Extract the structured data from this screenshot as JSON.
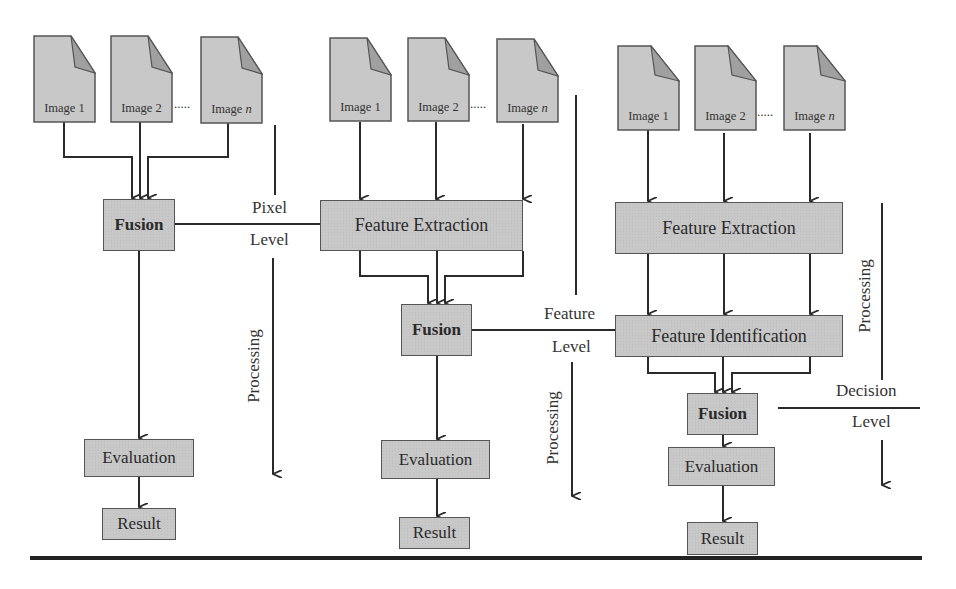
{
  "diagram": {
    "type": "image-fusion-levels",
    "columns": [
      {
        "id": "pixel",
        "inputs": [
          "Image 1",
          "Image 2",
          "Image n"
        ],
        "ellipsis": ".....",
        "steps": [
          "Fusion",
          "Evaluation",
          "Result"
        ]
      },
      {
        "id": "feature",
        "inputs": [
          "Image 1",
          "Image 2",
          "Image n"
        ],
        "ellipsis": ".....",
        "steps": [
          "Feature Extraction",
          "Fusion",
          "Evaluation",
          "Result"
        ]
      },
      {
        "id": "decision",
        "inputs": [
          "Image 1",
          "Image 2",
          "Image n"
        ],
        "ellipsis": ".....",
        "steps": [
          "Feature Extraction",
          "Feature Identification",
          "Fusion",
          "Evaluation",
          "Result"
        ]
      }
    ],
    "levels": {
      "pixel": {
        "top": "Pixel",
        "bottom": "Level",
        "processing": "Processing"
      },
      "feature": {
        "top": "Feature",
        "bottom": "Level",
        "processing": "Processing"
      },
      "decision": {
        "top": "Decision",
        "bottom": "Level",
        "processing": "Processing"
      }
    },
    "labels": {
      "image_prefix": "Image ",
      "image_1_num": "1",
      "image_2_num": "2",
      "image_n_num": "n"
    },
    "colors": {
      "box_fill": "#c8c8c8",
      "box_border": "#555555",
      "doc_fold": "#a0a0a0",
      "line": "#2a2a2a"
    }
  }
}
